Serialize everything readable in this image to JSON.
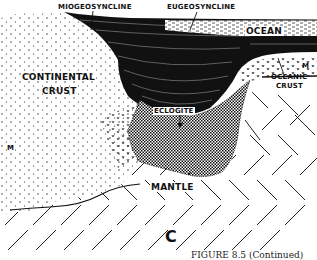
{
  "figure": {
    "panel_letter": "C",
    "caption": "FIGURE 8.5 (Continued)",
    "labels": {
      "miogeosyncline": "MIOGEOSYNCLINE",
      "eugeosyncline": "EUGEOSYNCLINE",
      "ocean": "OCEAN",
      "continental_crust_line1": "CONTINENTAL",
      "continental_crust_line2": "CRUST",
      "oceanic_crust_line1": "OCEANIC",
      "oceanic_crust_line2": "CRUST",
      "eclogite": "ECLOGITE",
      "mantle": "MANTLE",
      "moho_left": "M",
      "moho_right": "M"
    },
    "layers": [
      {
        "name": "continental-crust",
        "pattern": "stippled-dots"
      },
      {
        "name": "geosyncline-sediments",
        "pattern": "dense-black-wavy-lines"
      },
      {
        "name": "ocean",
        "pattern": "light-dashed"
      },
      {
        "name": "oceanic-crust",
        "pattern": "v-marks"
      },
      {
        "name": "eclogite",
        "pattern": "crosshatch-checker"
      },
      {
        "name": "mantle",
        "pattern": "herringbone-diagonals"
      }
    ],
    "colors": {
      "ink": "#111111",
      "paper": "#ffffff"
    }
  }
}
